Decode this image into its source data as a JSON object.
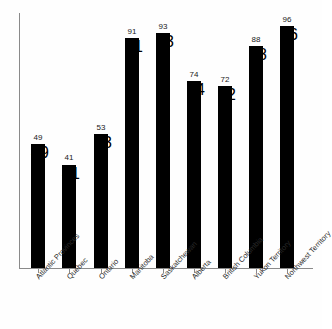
{
  "chart_data": {
    "type": "bar",
    "title": "",
    "subtitle": "",
    "xlabel": "",
    "ylabel": "",
    "categories": [
      "Atlantic Provinces",
      "Quebec",
      "Ontario",
      "Manitoba",
      "Saskatchewan",
      "Alberta",
      "British Columbia",
      "Yukon Territory",
      "Northwest Territory"
    ],
    "values": [
      49,
      41,
      53,
      91,
      93,
      74,
      72,
      88,
      96
    ],
    "value_labels": [
      "49",
      "41",
      "53",
      "91",
      "93",
      "74",
      "72",
      "88",
      "96"
    ],
    "ylim": [
      0,
      101
    ],
    "grid": false,
    "legend": false,
    "legend_position": "none",
    "y_tick_labels": [],
    "bar_color": "#000000",
    "axis_color": "#8a8a8a",
    "background_color": "#fefefe",
    "label_rotation_degrees": -47
  }
}
